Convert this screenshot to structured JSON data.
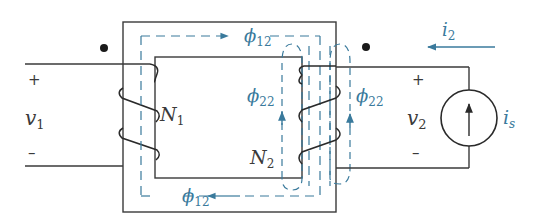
{
  "diagram": {
    "type": "magnetically-coupled-coils",
    "colors": {
      "line": "#3a3a3a",
      "flux": "#3a7a9c",
      "text": "#3a3a3a",
      "dot": "#1a1a1a"
    },
    "left_port": {
      "voltage_symbol": "v",
      "voltage_sub": "1",
      "plus": "+",
      "minus": "–"
    },
    "right_port": {
      "voltage_symbol": "v",
      "voltage_sub": "2",
      "plus": "+",
      "minus": "–"
    },
    "coil1": {
      "symbol": "N",
      "sub": "1"
    },
    "coil2": {
      "symbol": "N",
      "sub": "2"
    },
    "flux_top": {
      "symbol": "ϕ",
      "sub": "12"
    },
    "flux_bottom": {
      "symbol": "ϕ",
      "sub": "12"
    },
    "flux_leak_left": {
      "symbol": "ϕ",
      "sub": "22"
    },
    "flux_leak_right": {
      "symbol": "ϕ",
      "sub": "22"
    },
    "current": {
      "symbol": "i",
      "sub": "2"
    },
    "source": {
      "symbol": "i",
      "sub": "s"
    }
  }
}
